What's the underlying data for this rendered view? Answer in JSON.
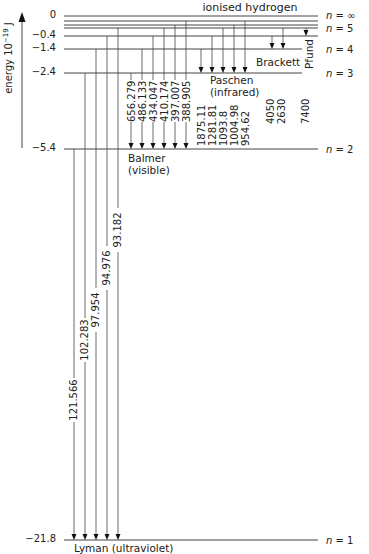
{
  "title": "ionised hydrogen",
  "axis": {
    "label": "energy 10",
    "exponent": "−19",
    "unit": " J"
  },
  "levels": [
    {
      "n": "∞",
      "energy": "0",
      "y": 16,
      "x1": 64,
      "x2": 318,
      "label": "n = ∞",
      "label_y": 17,
      "energy_y": 18
    },
    {
      "n": "7",
      "energy": "",
      "y": 21,
      "x1": 64,
      "x2": 318
    },
    {
      "n": "6",
      "energy": "",
      "y": 25,
      "x1": 64,
      "x2": 318
    },
    {
      "n": "5b",
      "energy": "",
      "y": 28,
      "x1": 64,
      "x2": 318
    },
    {
      "n": "5",
      "energy": "−0.4",
      "y": 36,
      "x1": 64,
      "x2": 318,
      "label": "n = 5",
      "label_y": 30,
      "energy_y": 38
    },
    {
      "n": "4",
      "energy": "−1.4",
      "y": 49,
      "x1": 64,
      "x2": 302,
      "label": "n = 4",
      "label_y": 51,
      "energy_y": 51
    },
    {
      "n": "3",
      "energy": "−2.4",
      "y": 73,
      "x1": 64,
      "x2": 302,
      "label": "n = 3",
      "label_y": 75,
      "energy_y": 75
    },
    {
      "n": "2",
      "energy": "−5.4",
      "y": 149,
      "x1": 64,
      "x2": 318,
      "label": "n = 2",
      "label_y": 151,
      "energy_y": 151
    },
    {
      "n": "1",
      "energy": "−21.8",
      "y": 540,
      "x1": 64,
      "x2": 318,
      "label": "n = 1",
      "label_y": 542,
      "energy_y": 542
    }
  ],
  "series": [
    {
      "name": "Lyman (ultraviolet)",
      "label_x": 74,
      "label_y": 552,
      "target_y": 540,
      "transitions": [
        {
          "x": 74,
          "from_y": 149,
          "wavelength": "121.566",
          "wl_y": 400
        },
        {
          "x": 85,
          "from_y": 73,
          "wavelength": "102.283",
          "wl_y": 340
        },
        {
          "x": 96,
          "from_y": 49,
          "wavelength": "97.954",
          "wl_y": 310
        },
        {
          "x": 107,
          "from_y": 36,
          "wavelength": "94.976",
          "wl_y": 268
        },
        {
          "x": 118,
          "from_y": 28,
          "wavelength": "93.182",
          "wl_y": 230
        }
      ]
    },
    {
      "name": "Balmer",
      "sub": "(visible)",
      "label_x": 128,
      "label_y": 162,
      "target_y": 149,
      "transitions": [
        {
          "x": 131,
          "from_y": 73,
          "wavelength": "656.279"
        },
        {
          "x": 142,
          "from_y": 49,
          "wavelength": "486.133"
        },
        {
          "x": 153,
          "from_y": 36,
          "wavelength": "434.047"
        },
        {
          "x": 164,
          "from_y": 28,
          "wavelength": "410.174"
        },
        {
          "x": 175,
          "from_y": 25,
          "wavelength": "397.007"
        },
        {
          "x": 186,
          "from_y": 21,
          "wavelength": "388.905"
        }
      ]
    },
    {
      "name": "Paschen",
      "sub": "(infrared)",
      "label_x": 210,
      "label_y": 84,
      "target_y": 73,
      "transitions": [
        {
          "x": 201,
          "from_y": 49,
          "wavelength": "1875.11"
        },
        {
          "x": 212,
          "from_y": 36,
          "wavelength": "1281.81"
        },
        {
          "x": 223,
          "from_y": 28,
          "wavelength": "1093.8"
        },
        {
          "x": 234,
          "from_y": 25,
          "wavelength": "1004.98"
        },
        {
          "x": 245,
          "from_y": 21,
          "wavelength": "954.62"
        }
      ]
    },
    {
      "name": "Brackett",
      "label_x": 256,
      "label_y": 66,
      "target_y": 49,
      "transitions": [
        {
          "x": 272,
          "from_y": 36,
          "wavelength": "4050"
        },
        {
          "x": 283,
          "from_y": 28,
          "wavelength": "2630"
        }
      ]
    },
    {
      "name": "Pfund",
      "label_x": 310,
      "label_y": 56,
      "target_y": 36,
      "transitions": [
        {
          "x": 306,
          "from_y": 28,
          "wavelength": "7400"
        }
      ]
    }
  ],
  "long_wavelengths": {
    "Brackett": [
      "4050",
      "2630"
    ],
    "Pfund": [
      "7400"
    ]
  }
}
